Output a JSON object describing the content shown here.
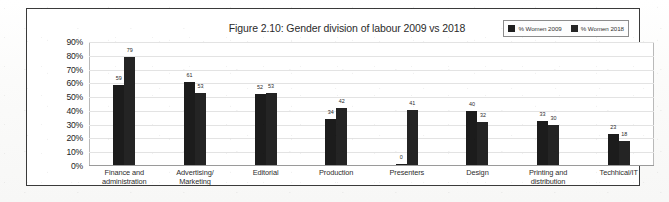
{
  "figure": {
    "title": "Figure 2.10: Gender division of labour 2009 vs 2018"
  },
  "legend": {
    "items": [
      {
        "label": "% Women 2009",
        "color": "#1c1c1c"
      },
      {
        "label": "% Women 2018",
        "color": "#242424"
      }
    ]
  },
  "axes": {
    "y_ticks": [
      "90%",
      "80%",
      "70%",
      "60%",
      "50%",
      "40%",
      "30%",
      "20%",
      "10%",
      "0%"
    ]
  },
  "chart_data": {
    "type": "bar",
    "title": "Figure 2.10: Gender division of labour 2009 vs 2018",
    "xlabel": "",
    "ylabel": "",
    "ylim": [
      0,
      90
    ],
    "ytick_step": 10,
    "grid": true,
    "legend_position": "top-right",
    "categories": [
      "Finance and administration",
      "Advertising/ Marketing",
      "Editorial",
      "Production",
      "Presenters",
      "Design",
      "Printing and distribution",
      "Techhical/IT"
    ],
    "series": [
      {
        "name": "% Women 2009",
        "color": "#1c1c1c",
        "values": [
          59,
          61,
          52,
          34,
          0,
          40,
          33,
          23
        ]
      },
      {
        "name": "% Women 2018",
        "color": "#242424",
        "values": [
          79,
          53,
          53,
          42,
          41,
          32,
          30,
          18
        ]
      }
    ]
  }
}
